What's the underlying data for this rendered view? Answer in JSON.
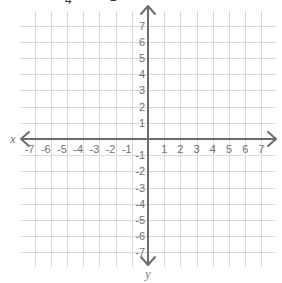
{
  "header": {
    "cropped_fragments": [
      {
        "text": "4",
        "x": 65,
        "y": -6
      },
      {
        "text": "2",
        "x": 110,
        "y": -9
      }
    ]
  },
  "plane": {
    "origin": {
      "x": 148,
      "y": 139
    },
    "unit_px": 16.2,
    "x_range": [
      -7,
      7
    ],
    "y_range": [
      -7,
      7
    ],
    "grid_extent": {
      "left": 20,
      "right": 276,
      "top": 11,
      "bottom": 267
    },
    "x_axis_label": "x",
    "y_axis_label": "y",
    "x_ticks": [
      "-7",
      "-6",
      "-5",
      "-4",
      "-3",
      "-2",
      "-1",
      "1",
      "2",
      "3",
      "4",
      "5",
      "6",
      "7"
    ],
    "y_ticks": [
      "7",
      "6",
      "5",
      "4",
      "3",
      "2",
      "1",
      "-1",
      "-2",
      "-3",
      "-4",
      "-5",
      "-6",
      "-7"
    ],
    "colors": {
      "grid": "#d9d9d9",
      "axis": "#6b6b6b",
      "label": "#707070"
    }
  }
}
